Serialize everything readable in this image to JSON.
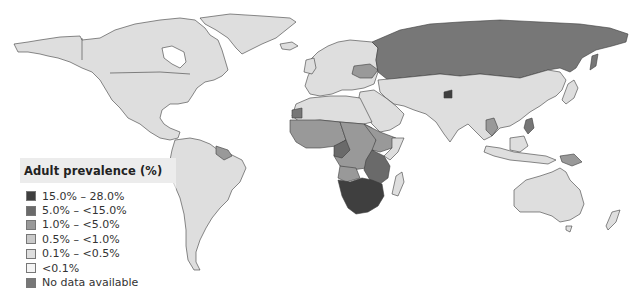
{
  "legend": {
    "title": "Adult prevalence (%)",
    "items": [
      {
        "label": "15.0% – 28.0%",
        "color": "#3f3f3f"
      },
      {
        "label": "5.0% – <15.0%",
        "color": "#6a6a6a"
      },
      {
        "label": "1.0% – <5.0%",
        "color": "#999999"
      },
      {
        "label": "0.5% – <1.0%",
        "color": "#c9c9c9"
      },
      {
        "label": "0.1% – <0.5%",
        "color": "#dedede"
      },
      {
        "label": "<0.1%",
        "color": "#f4f4f4"
      },
      {
        "label": "No data available",
        "color": "#777777"
      }
    ]
  },
  "map": {
    "title": "Adult HIV prevalence world map",
    "regions": [
      {
        "name": "North America",
        "class": "0.1% – <0.5%"
      },
      {
        "name": "Greenland",
        "class": "0.1% – <0.5%"
      },
      {
        "name": "South America",
        "class": "0.1% – <0.5%"
      },
      {
        "name": "Europe",
        "class": "0.1% – <0.5%"
      },
      {
        "name": "Russia",
        "class": "No data available"
      },
      {
        "name": "Asia",
        "class": "0.1% – <0.5%"
      },
      {
        "name": "North Africa",
        "class": "0.1% – <0.5%"
      },
      {
        "name": "West & Central Africa",
        "class": "1.0% – <5.0%"
      },
      {
        "name": "East Africa",
        "class": "5.0% – <15.0%"
      },
      {
        "name": "Southern Africa",
        "class": "15.0% – 28.0%"
      },
      {
        "name": "Australia",
        "class": "0.1% – <0.5%"
      },
      {
        "name": "Papua New Guinea",
        "class": "1.0% – <5.0%"
      }
    ]
  }
}
